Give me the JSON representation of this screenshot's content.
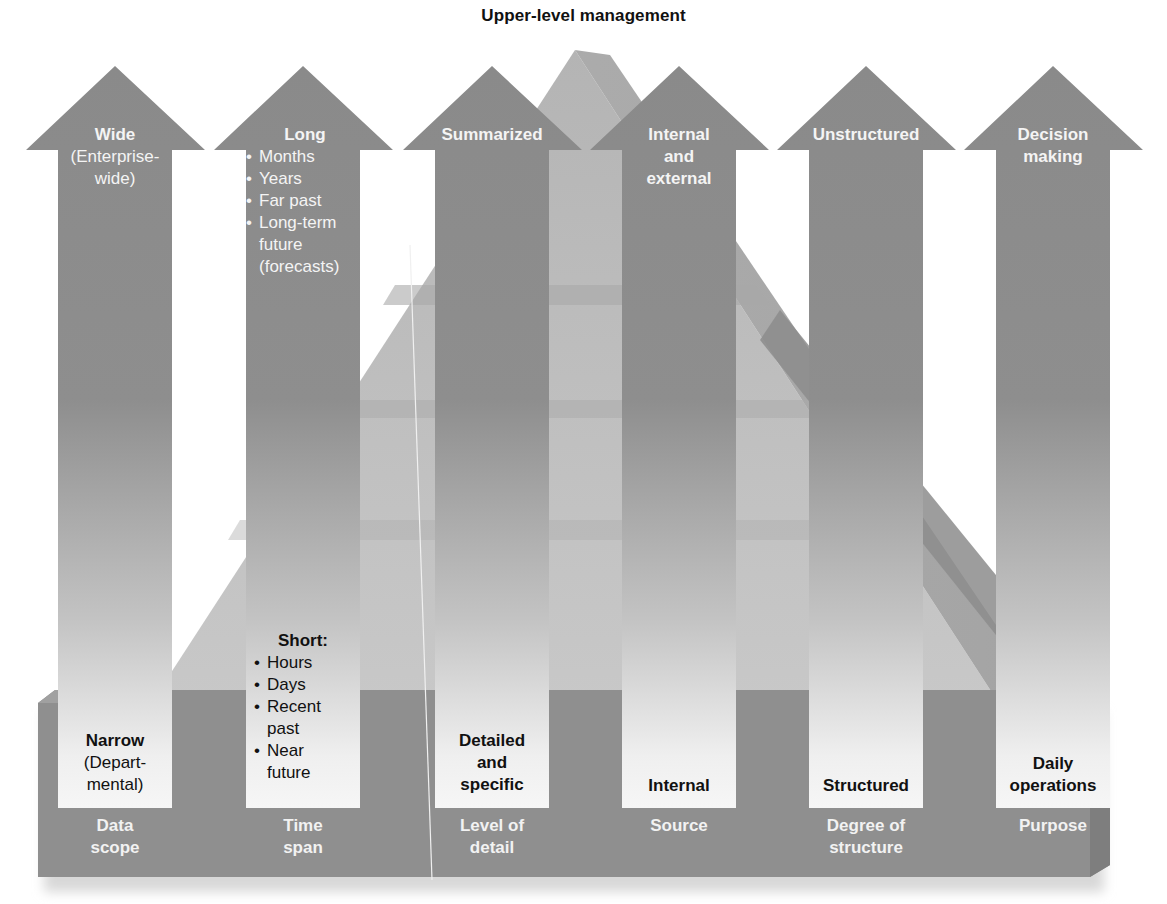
{
  "title": "Upper-level management",
  "colors": {
    "arrow_dark": "#8a8a8a",
    "arrow_light": "#f2f2f2",
    "base": "#8f8f8f",
    "pyramid": "#b9b9b9",
    "top_text": "#f4f4f4",
    "bottom_text": "#111111"
  },
  "columns": [
    {
      "axis": [
        "Data",
        "scope"
      ],
      "top": {
        "head": "Wide",
        "sub": [
          "(Enterprise-",
          "wide)"
        ],
        "bullets": []
      },
      "bottom": {
        "head": "Narrow",
        "sub": [
          "(Depart-",
          "mental)"
        ],
        "bullets": []
      }
    },
    {
      "axis": [
        "Time",
        "span"
      ],
      "top": {
        "head": "Long",
        "sub": [],
        "bullets": [
          "Months",
          "Years",
          "Far past",
          "Long-term future (forecasts)"
        ]
      },
      "bottom": {
        "head": "Short:",
        "sub": [],
        "bullets": [
          "Hours",
          "Days",
          "Recent past",
          "Near future"
        ]
      }
    },
    {
      "axis": [
        "Level of",
        "detail"
      ],
      "top": {
        "head": "Summarized",
        "sub": [],
        "bullets": []
      },
      "bottom": {
        "head": "Detailed and specific",
        "sub": [],
        "bullets": []
      }
    },
    {
      "axis": [
        "Source"
      ],
      "top": {
        "head": "Internal and external",
        "sub": [],
        "bullets": []
      },
      "bottom": {
        "head": "Internal",
        "sub": [],
        "bullets": []
      }
    },
    {
      "axis": [
        "Degree of",
        "structure"
      ],
      "top": {
        "head": "Unstructured",
        "sub": [],
        "bullets": []
      },
      "bottom": {
        "head": "Structured",
        "sub": [],
        "bullets": []
      }
    },
    {
      "axis": [
        "Purpose"
      ],
      "top": {
        "head": "Decision making",
        "sub": [],
        "bullets": []
      },
      "bottom": {
        "head": "Daily operations",
        "sub": [],
        "bullets": []
      }
    }
  ],
  "labels": {
    "c0_top_head": "Wide",
    "c0_top_sub1": "(Enterprise-",
    "c0_top_sub2": "wide)",
    "c0_bot_head": "Narrow",
    "c0_bot_sub1": "(Depart-",
    "c0_bot_sub2": "mental)",
    "c0_axis1": "Data",
    "c0_axis2": "scope",
    "c1_top_head": "Long",
    "c1_top_b1": "Months",
    "c1_top_b2": "Years",
    "c1_top_b3": "Far past",
    "c1_top_b4a": "Long-term",
    "c1_top_b4b": "future",
    "c1_top_b4c": "(forecasts)",
    "c1_bot_head": "Short:",
    "c1_bot_b1": "Hours",
    "c1_bot_b2": "Days",
    "c1_bot_b3a": "Recent",
    "c1_bot_b3b": "past",
    "c1_bot_b4a": "Near",
    "c1_bot_b4b": "future",
    "c1_axis1": "Time",
    "c1_axis2": "span",
    "c2_top_head": "Summarized",
    "c2_bot_l1": "Detailed",
    "c2_bot_l2": "and",
    "c2_bot_l3": "specific",
    "c2_axis1": "Level of",
    "c2_axis2": "detail",
    "c3_top_l1": "Internal",
    "c3_top_l2": "and",
    "c3_top_l3": "external",
    "c3_bot_head": "Internal",
    "c3_axis1": "Source",
    "c4_top_head": "Unstructured",
    "c4_bot_head": "Structured",
    "c4_axis1": "Degree of",
    "c4_axis2": "structure",
    "c5_top_l1": "Decision",
    "c5_top_l2": "making",
    "c5_bot_l1": "Daily",
    "c5_bot_l2": "operations",
    "c5_axis1": "Purpose"
  }
}
